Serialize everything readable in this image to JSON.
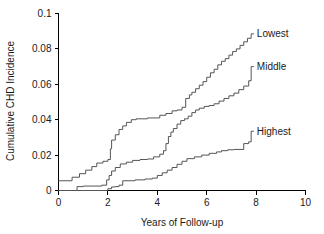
{
  "chart_data": {
    "type": "line",
    "subtype": "step",
    "title": "",
    "xlabel": "Years of Follow-up",
    "ylabel": "Cumulative CHD Incidence",
    "xlim": [
      0,
      10
    ],
    "ylim": [
      0,
      0.1
    ],
    "xticks": [
      0,
      2,
      4,
      6,
      8,
      10
    ],
    "xtick_labels": [
      "0",
      "2",
      "4",
      "6",
      "8",
      "10"
    ],
    "yticks": [
      0,
      0.02,
      0.04,
      0.06,
      0.08,
      0.1
    ],
    "ytick_labels": [
      "0",
      "0.02",
      "0.04",
      "0.06",
      "0.08",
      "0.1"
    ],
    "grid": false,
    "legend_position": "right-of-curve-end",
    "line_color": "#555555",
    "axis_color": "#000000",
    "series": [
      {
        "name": "Lowest",
        "label": "Lowest",
        "label_x": 7.95,
        "label_y": 0.0885,
        "x": [
          0.0,
          0.05,
          0.55,
          0.85,
          1.1,
          1.35,
          1.55,
          1.8,
          2.0,
          2.1,
          2.15,
          2.3,
          2.45,
          2.6,
          2.75,
          2.95,
          3.15,
          3.6,
          4.1,
          4.35,
          4.6,
          4.8,
          5.0,
          5.15,
          5.3,
          5.4,
          5.55,
          5.7,
          5.85,
          6.0,
          6.15,
          6.3,
          6.45,
          6.6,
          6.75,
          6.9,
          7.05,
          7.2,
          7.35,
          7.5,
          7.65,
          7.8
        ],
        "y": [
          0.0055,
          0.0055,
          0.0075,
          0.0095,
          0.0115,
          0.0135,
          0.0155,
          0.0165,
          0.0175,
          0.0235,
          0.0285,
          0.0315,
          0.0345,
          0.0365,
          0.0385,
          0.04,
          0.0405,
          0.041,
          0.0425,
          0.0435,
          0.045,
          0.0455,
          0.047,
          0.052,
          0.054,
          0.0555,
          0.0575,
          0.0595,
          0.0615,
          0.064,
          0.0665,
          0.0685,
          0.071,
          0.073,
          0.0745,
          0.0765,
          0.0785,
          0.08,
          0.082,
          0.084,
          0.086,
          0.088
        ]
      },
      {
        "name": "Middle",
        "label": "Middle",
        "label_x": 7.95,
        "label_y": 0.07,
        "x": [
          0.0,
          0.6,
          0.75,
          1.0,
          1.75,
          1.95,
          2.05,
          2.15,
          2.3,
          2.5,
          2.75,
          3.0,
          3.3,
          3.6,
          3.85,
          4.1,
          4.25,
          4.35,
          4.45,
          4.55,
          4.65,
          4.8,
          4.95,
          5.1,
          5.25,
          5.4,
          5.55,
          5.7,
          5.9,
          6.1,
          6.3,
          6.5,
          6.7,
          6.9,
          7.1,
          7.3,
          7.5,
          7.7,
          7.8
        ],
        "y": [
          0.0,
          0.0,
          0.0022,
          0.0025,
          0.003,
          0.006,
          0.0085,
          0.011,
          0.013,
          0.015,
          0.016,
          0.017,
          0.0175,
          0.0178,
          0.019,
          0.0205,
          0.0225,
          0.0265,
          0.0305,
          0.033,
          0.035,
          0.0375,
          0.0395,
          0.0405,
          0.042,
          0.044,
          0.0455,
          0.0465,
          0.0475,
          0.048,
          0.049,
          0.0505,
          0.052,
          0.0535,
          0.055,
          0.057,
          0.059,
          0.062,
          0.07
        ]
      },
      {
        "name": "Highest",
        "label": "Highest",
        "label_x": 7.95,
        "label_y": 0.0335,
        "x": [
          0.0,
          1.85,
          2.0,
          2.15,
          2.3,
          2.45,
          2.6,
          3.1,
          3.5,
          3.8,
          4.0,
          4.2,
          4.4,
          4.6,
          4.8,
          5.0,
          5.2,
          5.5,
          5.8,
          6.1,
          6.4,
          6.6,
          6.85,
          7.1,
          7.5,
          7.7,
          7.8
        ],
        "y": [
          0.0,
          0.0,
          0.001,
          0.002,
          0.0022,
          0.003,
          0.0055,
          0.006,
          0.0065,
          0.007,
          0.0085,
          0.01,
          0.0115,
          0.013,
          0.0148,
          0.0165,
          0.018,
          0.019,
          0.02,
          0.021,
          0.0218,
          0.0225,
          0.023,
          0.0232,
          0.0265,
          0.0275,
          0.0335
        ]
      }
    ]
  }
}
